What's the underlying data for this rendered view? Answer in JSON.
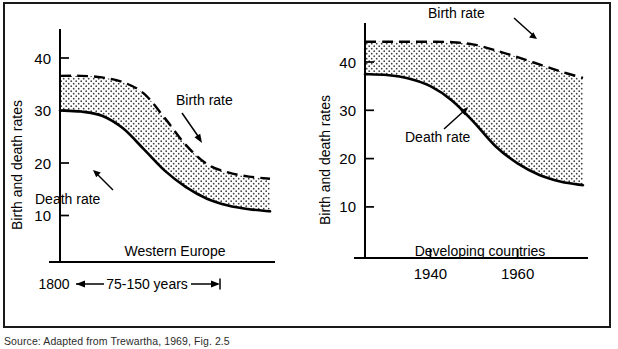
{
  "figure": {
    "source_caption": "Source:   Adapted from Trewartha, 1969, Fig. 2.5",
    "ink_color": "#000000",
    "background_color": "#ffffff",
    "stipple_color": "#3c3c3c"
  },
  "chart_data": [
    {
      "type": "area",
      "title": "Western Europe",
      "panel_id": "western-europe",
      "xlabel": "1800 ←— 75-150 years —→|",
      "ylabel": "Birth and death rates",
      "ylim": [
        0,
        46
      ],
      "yticks": [
        10,
        20,
        30,
        40
      ],
      "ytick_labels": [
        "10",
        "20",
        "30",
        "40"
      ],
      "xlim": [
        0,
        100
      ],
      "xticks": [],
      "xtick_labels": [],
      "grid": false,
      "legend": "inline-annotations",
      "x_axis_start_label": "1800",
      "x_axis_span_label": "75-150 years",
      "series": [
        {
          "name": "Birth rate",
          "style": "dashed",
          "x": [
            0,
            10,
            20,
            30,
            40,
            50,
            60,
            70,
            80,
            90,
            100
          ],
          "values": [
            36.6,
            36.6,
            36.3,
            35.4,
            33.2,
            28.5,
            23.4,
            19.8,
            18.2,
            17.4,
            17.0
          ]
        },
        {
          "name": "Death rate",
          "style": "solid",
          "x": [
            0,
            10,
            20,
            30,
            40,
            50,
            60,
            70,
            80,
            90,
            100
          ],
          "values": [
            30.0,
            29.8,
            29.0,
            26.6,
            22.6,
            18.5,
            15.4,
            13.2,
            11.9,
            11.2,
            10.8
          ]
        }
      ],
      "annotations": [
        {
          "text": "Birth rate",
          "points_to": "birth-rate-curve"
        },
        {
          "text": "Death rate",
          "points_to": "death-rate-curve"
        }
      ]
    },
    {
      "type": "area",
      "title": "Developing countries",
      "panel_id": "developing-countries",
      "xlabel": "",
      "ylabel": "Birth and death rates",
      "ylim": [
        0,
        46
      ],
      "yticks": [
        10,
        20,
        30,
        40
      ],
      "ytick_labels": [
        "10",
        "20",
        "30",
        "40"
      ],
      "xlim": [
        1925,
        1975
      ],
      "xticks": [
        1940,
        1960
      ],
      "xtick_labels": [
        "1940",
        "1960"
      ],
      "grid": false,
      "legend": "inline-annotations",
      "series": [
        {
          "name": "Birth rate",
          "style": "dashed",
          "x": [
            1925,
            1930,
            1935,
            1940,
            1945,
            1950,
            1955,
            1960,
            1965,
            1970,
            1975
          ],
          "values": [
            44.2,
            44.2,
            44.2,
            44.2,
            44.1,
            43.6,
            42.4,
            41.0,
            39.5,
            38.0,
            36.7
          ]
        },
        {
          "name": "Death rate",
          "style": "solid",
          "x": [
            1925,
            1930,
            1935,
            1940,
            1945,
            1950,
            1955,
            1960,
            1965,
            1970,
            1975
          ],
          "values": [
            37.5,
            37.3,
            36.6,
            35.0,
            32.0,
            27.5,
            22.5,
            19.0,
            16.6,
            15.2,
            14.5
          ]
        }
      ],
      "annotations": [
        {
          "text": "Birth rate",
          "points_to": "birth-rate-curve"
        },
        {
          "text": "Death rate",
          "points_to": "death-rate-curve"
        }
      ]
    }
  ]
}
